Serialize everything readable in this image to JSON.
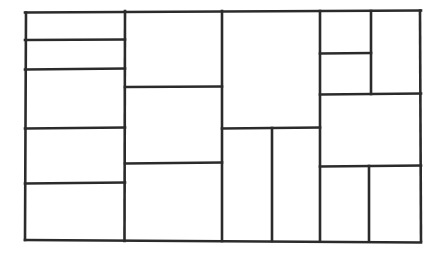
{
  "figure": {
    "style": "hand-drawn",
    "background_color": "#ffffff",
    "line_color": "#2b2b2b",
    "line_width": 2.6,
    "canvas": {
      "width": 443,
      "height": 254
    },
    "outer_border": {
      "x1": 25,
      "y1": 11.5,
      "x2": 421,
      "y2": 240.5
    }
  },
  "layout": {
    "columns": [
      {
        "name": "column-1",
        "x1": 25,
        "x2": 125
      },
      {
        "name": "column-2",
        "x1": 125,
        "x2": 222
      },
      {
        "name": "column-3",
        "x1": 222,
        "x2": 320
      },
      {
        "name": "column-4",
        "x1": 320,
        "x2": 421
      }
    ]
  },
  "cells": [
    {
      "id": 1,
      "name": "cell-c1-r1",
      "x": 25,
      "y": 11,
      "w": 100,
      "h": 29
    },
    {
      "id": 2,
      "name": "cell-c1-r2",
      "x": 25,
      "y": 40,
      "w": 100,
      "h": 29
    },
    {
      "id": 3,
      "name": "cell-c1-r3",
      "x": 25,
      "y": 69,
      "w": 100,
      "h": 59
    },
    {
      "id": 4,
      "name": "cell-c1-r4",
      "x": 25,
      "y": 128,
      "w": 100,
      "h": 55
    },
    {
      "id": 5,
      "name": "cell-c1-r5",
      "x": 25,
      "y": 183,
      "w": 100,
      "h": 58
    },
    {
      "id": 6,
      "name": "cell-c2-r1",
      "x": 125,
      "y": 11,
      "w": 97,
      "h": 76
    },
    {
      "id": 7,
      "name": "cell-c2-r2",
      "x": 125,
      "y": 87,
      "w": 97,
      "h": 76
    },
    {
      "id": 8,
      "name": "cell-c2-r3",
      "x": 125,
      "y": 163,
      "w": 97,
      "h": 78
    },
    {
      "id": 9,
      "name": "cell-c3-r1",
      "x": 222,
      "y": 11,
      "w": 98,
      "h": 117
    },
    {
      "id": 10,
      "name": "cell-c3-r2-left",
      "x": 222,
      "y": 128,
      "w": 50,
      "h": 113
    },
    {
      "id": 11,
      "name": "cell-c3-r2-right",
      "x": 272,
      "y": 128,
      "w": 48,
      "h": 113
    },
    {
      "id": 12,
      "name": "cell-c4-r1-left-top",
      "x": 320,
      "y": 11,
      "w": 51,
      "h": 42
    },
    {
      "id": 13,
      "name": "cell-c4-r1-left-bottom",
      "x": 320,
      "y": 53,
      "w": 51,
      "h": 41
    },
    {
      "id": 14,
      "name": "cell-c4-r1-right",
      "x": 371,
      "y": 11,
      "w": 50,
      "h": 83
    },
    {
      "id": 15,
      "name": "cell-c4-r2",
      "x": 320,
      "y": 94,
      "w": 101,
      "h": 72
    },
    {
      "id": 16,
      "name": "cell-c4-r3-left",
      "x": 320,
      "y": 166,
      "w": 49,
      "h": 75
    },
    {
      "id": 17,
      "name": "cell-c4-r3-right",
      "x": 369,
      "y": 166,
      "w": 52,
      "h": 75
    }
  ],
  "segments": {
    "outer": [
      {
        "name": "border-top",
        "x1": 25,
        "y1": 12.5,
        "x2": 421,
        "y2": 10.5
      },
      {
        "name": "border-right",
        "x1": 420,
        "y1": 10.5,
        "x2": 421,
        "y2": 241
      },
      {
        "name": "border-bottom",
        "x1": 25,
        "y1": 240,
        "x2": 421,
        "y2": 242.5
      },
      {
        "name": "border-left",
        "x1": 26,
        "y1": 12.5,
        "x2": 25,
        "y2": 240
      }
    ],
    "vertical": [
      {
        "name": "divider-v-col1-col2",
        "x1": 125,
        "y1": 11,
        "x2": 124.5,
        "y2": 241
      },
      {
        "name": "divider-v-col2-col3",
        "x1": 222,
        "y1": 11,
        "x2": 222,
        "y2": 241
      },
      {
        "name": "divider-v-col3-col4",
        "x1": 320,
        "y1": 11,
        "x2": 320,
        "y2": 241
      },
      {
        "name": "divider-v-c3-bottom",
        "x1": 272,
        "y1": 128,
        "x2": 272,
        "y2": 241
      },
      {
        "name": "divider-v-c4-top",
        "x1": 371,
        "y1": 11,
        "x2": 371,
        "y2": 94
      },
      {
        "name": "divider-v-c4-bottom",
        "x1": 369,
        "y1": 166,
        "x2": 369,
        "y2": 241
      }
    ],
    "horizontal": [
      {
        "name": "divider-h-c1-1",
        "x1": 25,
        "y1": 40,
        "x2": 125,
        "y2": 39.5
      },
      {
        "name": "divider-h-c1-2",
        "x1": 25,
        "y1": 69.5,
        "x2": 125,
        "y2": 68.5
      },
      {
        "name": "divider-h-c1-3",
        "x1": 25,
        "y1": 128.5,
        "x2": 125,
        "y2": 127.5
      },
      {
        "name": "divider-h-c1-4",
        "x1": 25,
        "y1": 183.5,
        "x2": 125,
        "y2": 182.5
      },
      {
        "name": "divider-h-c2-1",
        "x1": 125,
        "y1": 87,
        "x2": 222,
        "y2": 86.5
      },
      {
        "name": "divider-h-c2-2",
        "x1": 125,
        "y1": 163.5,
        "x2": 222,
        "y2": 162.5
      },
      {
        "name": "divider-h-c3-1",
        "x1": 222,
        "y1": 128.5,
        "x2": 320,
        "y2": 127.5
      },
      {
        "name": "divider-h-c4-1",
        "x1": 320,
        "y1": 53.5,
        "x2": 371,
        "y2": 53
      },
      {
        "name": "divider-h-c4-2",
        "x1": 320,
        "y1": 94.5,
        "x2": 421,
        "y2": 93.5
      },
      {
        "name": "divider-h-c4-3",
        "x1": 320,
        "y1": 166.5,
        "x2": 421,
        "y2": 165.5
      }
    ]
  }
}
